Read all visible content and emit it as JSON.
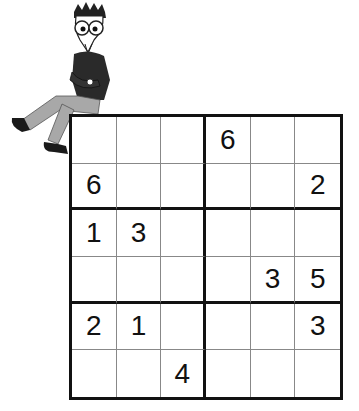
{
  "puzzle": {
    "type": "sudoku-6x6",
    "box_rows": 2,
    "box_cols": 3,
    "cells": [
      [
        "",
        "",
        "",
        "6",
        "",
        ""
      ],
      [
        "6",
        "",
        "",
        "",
        "",
        "2"
      ],
      [
        "1",
        "3",
        "",
        "",
        "",
        ""
      ],
      [
        "",
        "",
        "",
        "",
        "3",
        "5"
      ],
      [
        "2",
        "1",
        "",
        "",
        "",
        "3"
      ],
      [
        "",
        "",
        "4",
        "",
        "",
        ""
      ]
    ]
  },
  "illustration": {
    "subject": "cartoon man with glasses sitting on grid corner",
    "colors": {
      "shirt": "#2a2a2a",
      "pants": "#a8a8a8",
      "shoes": "#1a1a1a",
      "skin": "#ffffff"
    }
  }
}
